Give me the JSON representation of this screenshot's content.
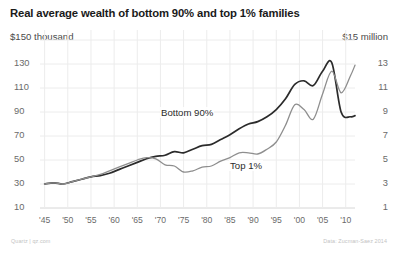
{
  "title": "Real average wealth of bottom 90% and top 1% families",
  "credits": {
    "left": "Quartz | qz.com",
    "right": "Data: Zucman-Saez 2014"
  },
  "labels": {
    "bottom90": "Bottom 90%",
    "top1": "Top 1%"
  },
  "axis_caps": {
    "left": "$150 thousand",
    "right": "$15 million"
  },
  "colors": {
    "bottom90": "#2b2b2b",
    "top1": "#8e8e8e",
    "grid": "#ececec",
    "axis": "#d6d6d6",
    "text": "#2b2b2b",
    "muted": "#6a6a6a",
    "credit": "#c3c3c3",
    "background": "#ffffff"
  },
  "chart_data": {
    "type": "line",
    "title": "Real average wealth of bottom 90% and top 1% families",
    "xlabel": "",
    "ylabel": "$150 thousand",
    "y2label": "$15 million",
    "grid": true,
    "legend": "inline-annotation",
    "xlim": [
      1944,
      2012
    ],
    "ylim": [
      10,
      150
    ],
    "y2lim": [
      1,
      15
    ],
    "xticks": [
      "'45",
      "'50",
      "'55",
      "'60",
      "'65",
      "'70",
      "'75",
      "'80",
      "'85",
      "'90",
      "'95",
      "'00",
      "'05",
      "'10"
    ],
    "xtick_values": [
      1945,
      1950,
      1955,
      1960,
      1965,
      1970,
      1975,
      1980,
      1985,
      1990,
      1995,
      2000,
      2005,
      2010
    ],
    "yticks_left": [
      150,
      130,
      110,
      90,
      70,
      50,
      30,
      10
    ],
    "ytick_labels_left": [
      "$150 thousand",
      "130",
      "110",
      "90",
      "70",
      "50",
      "30",
      "10"
    ],
    "yticks_right": [
      15,
      13,
      11,
      9,
      7,
      5,
      3,
      1
    ],
    "ytick_labels_right": [
      "$15 million",
      "13",
      "11",
      "9",
      "7",
      "5",
      "3",
      "1"
    ],
    "series": [
      {
        "name": "Bottom 90%",
        "axis": "left",
        "units": "thousands of dollars",
        "color": "#2b2b2b",
        "x": [
          1945,
          1947,
          1949,
          1951,
          1953,
          1955,
          1957,
          1959,
          1961,
          1963,
          1965,
          1967,
          1969,
          1971,
          1973,
          1975,
          1977,
          1979,
          1981,
          1983,
          1985,
          1987,
          1989,
          1991,
          1993,
          1995,
          1997,
          1999,
          2001,
          2003,
          2005,
          2007,
          2009,
          2011,
          2012
        ],
        "values": [
          30,
          31,
          30,
          32,
          34,
          36,
          37,
          39,
          42,
          45,
          48,
          51,
          53,
          54,
          57,
          56,
          59,
          62,
          63,
          67,
          71,
          76,
          80,
          82,
          86,
          92,
          101,
          113,
          116,
          112,
          124,
          131,
          90,
          86,
          87
        ]
      },
      {
        "name": "Top 1%",
        "axis": "right",
        "units": "millions of dollars",
        "color": "#8e8e8e",
        "x": [
          1945,
          1947,
          1949,
          1951,
          1953,
          1955,
          1957,
          1959,
          1961,
          1963,
          1965,
          1967,
          1969,
          1971,
          1973,
          1975,
          1977,
          1979,
          1981,
          1983,
          1985,
          1987,
          1989,
          1991,
          1993,
          1995,
          1997,
          1999,
          2001,
          2003,
          2005,
          2007,
          2009,
          2011,
          2012
        ],
        "values": [
          3.0,
          3.1,
          3.0,
          3.2,
          3.4,
          3.6,
          3.8,
          4.1,
          4.4,
          4.7,
          5.0,
          5.2,
          5.1,
          4.6,
          4.5,
          4.0,
          4.1,
          4.4,
          4.5,
          4.9,
          5.2,
          5.6,
          5.6,
          5.5,
          5.9,
          6.5,
          7.9,
          9.6,
          9.2,
          8.4,
          10.5,
          12.4,
          10.6,
          12.0,
          12.9
        ]
      }
    ]
  }
}
